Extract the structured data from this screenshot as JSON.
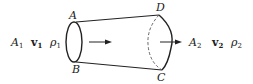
{
  "diagram": {
    "colors": {
      "stroke": "#222222",
      "background": "#ffffff"
    },
    "points": {
      "A": "A",
      "B": "B",
      "C": "C",
      "D": "D"
    },
    "inlet": {
      "area": {
        "sym": "A",
        "sub": "1"
      },
      "velocity": {
        "sym": "v",
        "sub": "1"
      },
      "density": {
        "sym": "ρ",
        "sub": "1"
      }
    },
    "outlet": {
      "area": {
        "sym": "A",
        "sub": "2"
      },
      "velocity": {
        "sym": "v",
        "sub": "2"
      },
      "density": {
        "sym": "ρ",
        "sub": "2"
      }
    },
    "arrows": [
      "flow-arrow-inside",
      "flow-arrow-outlet"
    ]
  }
}
